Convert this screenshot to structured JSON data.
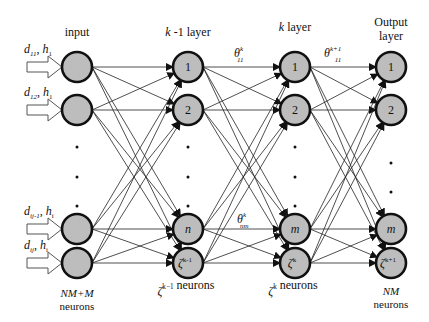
{
  "diagram": {
    "layers": [
      {
        "id": "input",
        "title": [
          "input"
        ],
        "title_italic_prefix": "",
        "nodes": [
          "",
          "",
          "",
          ""
        ],
        "dot_count": 3,
        "footer": [
          "NM+M",
          "neurons"
        ],
        "footer_italic_first_line": true
      },
      {
        "id": "k-1",
        "title_parts": [
          {
            "t": "k",
            "it": true
          },
          {
            "t": " -1  layer",
            "it": false
          }
        ],
        "nodes": [
          "1",
          "2",
          "n",
          "ζ^k-1"
        ],
        "dot_count": 3,
        "footer_parts": [
          {
            "t": "ζ",
            "it": true,
            "sup": "k−1"
          },
          {
            "t": "  neurons",
            "it": false
          }
        ]
      },
      {
        "id": "k",
        "title_parts": [
          {
            "t": "k",
            "it": true
          },
          {
            "t": " layer",
            "it": false
          }
        ],
        "nodes": [
          "1",
          "2",
          "m",
          "ζ^k"
        ],
        "dot_count": 3,
        "footer_parts": [
          {
            "t": "ζ",
            "it": true,
            "sup": "k"
          },
          {
            "t": "  neurons",
            "it": false
          }
        ]
      },
      {
        "id": "output",
        "title": [
          "Output",
          "layer"
        ],
        "nodes": [
          "1",
          "2",
          "m",
          "ζ^k+1"
        ],
        "dot_count": 2,
        "footer": [
          "NM",
          "neurons"
        ],
        "footer_italic_first_line": true
      }
    ],
    "inputs": [
      {
        "d": "d",
        "d_sub": "11",
        "h": "h",
        "h_sub": "1"
      },
      {
        "d": "d",
        "d_sub": "12",
        "h": "h",
        "h_sub": "1"
      },
      {
        "d": "d",
        "d_sub": "ij-1",
        "h": "h",
        "h_sub": "i"
      },
      {
        "d": "d",
        "d_sub": "ij",
        "h": "h",
        "h_sub": "i"
      }
    ],
    "weight_labels": [
      {
        "sym": "θ",
        "sup": "k",
        "sub": "11"
      },
      {
        "sym": "θ",
        "sup": "k+1",
        "sub": "11"
      },
      {
        "sym": "θ",
        "sup": "k",
        "sub": "nm"
      }
    ]
  }
}
